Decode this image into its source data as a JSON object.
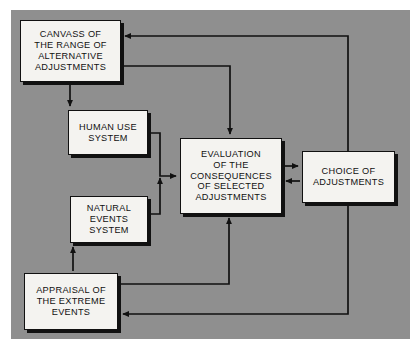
{
  "figure": {
    "background_color": "#8f8f8f",
    "box_fill_color": "#f4f3f0",
    "line_color": "#111111",
    "caption": ""
  },
  "boxes": [
    {
      "id": "canvass",
      "label": "CANVASS OF\nTHE RANGE OF\nALTERNATIVE\nADJUSTMENTS",
      "lines": [
        "CANVASS OF",
        "THE RANGE OF",
        "ALTERNATIVE",
        "ADJUSTMENTS"
      ],
      "x": 20,
      "y": 20,
      "w": 101,
      "h": 62
    },
    {
      "id": "human",
      "label": "HUMAN USE\nSYSTEM",
      "lines": [
        "HUMAN USE",
        "SYSTEM"
      ],
      "x": 68,
      "y": 110,
      "w": 80,
      "h": 45
    },
    {
      "id": "natural",
      "label": "NATURAL\nEVENTS\nSYSTEM",
      "lines": [
        "NATURAL",
        "EVENTS",
        "SYSTEM"
      ],
      "x": 70,
      "y": 196,
      "w": 78,
      "h": 47
    },
    {
      "id": "evaluation",
      "label": "EVALUATION\nOF THE\nCONSEQUENCES\nOF SELECTED\nADJUSTMENTS",
      "lines": [
        "EVALUATION",
        "OF THE",
        "CONSEQUENCES",
        "OF SELECTED",
        "ADJUSTMENTS"
      ],
      "x": 180,
      "y": 138,
      "w": 102,
      "h": 76
    },
    {
      "id": "choice",
      "label": "CHOICE OF\nADJUSTMENTS",
      "lines": [
        "CHOICE OF",
        "ADJUSTMENTS"
      ],
      "x": 302,
      "y": 151,
      "w": 93,
      "h": 52
    },
    {
      "id": "appraisal",
      "label": "APPRAISAL OF\nTHE EXTREME\nEVENTS",
      "lines": [
        "APPRAISAL OF",
        "THE EXTREME",
        "EVENTS"
      ],
      "x": 24,
      "y": 273,
      "w": 94,
      "h": 57
    }
  ],
  "connectors": [
    {
      "id": "choice-to-canvass",
      "from": "choice",
      "to": "canvass",
      "arrow": "single"
    },
    {
      "id": "canvass-to-evaluation",
      "from": "canvass",
      "to": "evaluation",
      "arrow": "single"
    },
    {
      "id": "canvass-to-human",
      "from": "canvass",
      "to": "human",
      "arrow": "single"
    },
    {
      "id": "human-to-evaluation",
      "from": "human",
      "to": "evaluation",
      "arrow": "single"
    },
    {
      "id": "natural-to-evaluation",
      "from": "natural",
      "to": "evaluation",
      "arrow": "single"
    },
    {
      "id": "evaluation-to-choice",
      "from": "evaluation",
      "to": "choice",
      "arrow": "single"
    },
    {
      "id": "choice-to-evaluation",
      "from": "choice",
      "to": "evaluation",
      "arrow": "single"
    },
    {
      "id": "appraisal-to-natural",
      "from": "appraisal",
      "to": "natural",
      "arrow": "single"
    },
    {
      "id": "appraisal-to-evaluation",
      "from": "appraisal",
      "to": "evaluation",
      "arrow": "single"
    },
    {
      "id": "choice-to-appraisal",
      "from": "choice",
      "to": "appraisal",
      "arrow": "single"
    }
  ]
}
